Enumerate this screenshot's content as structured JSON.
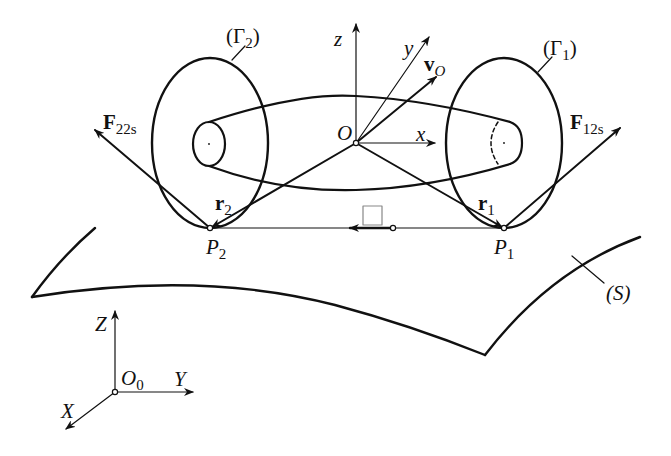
{
  "figure": {
    "colors": {
      "stroke": "#111111",
      "background": "#ffffff"
    }
  },
  "labels": {
    "gamma2": {
      "main": "(Γ",
      "sub": "2",
      "close": ")"
    },
    "gamma1": {
      "main": "(Γ",
      "sub": "1",
      "close": ")"
    },
    "z": "z",
    "y": "y",
    "x": "x",
    "O": "O",
    "vO": {
      "main": "v",
      "sub": "O"
    },
    "F22s": {
      "main": "F",
      "sub": "22s"
    },
    "F12s": {
      "main": "F",
      "sub": "12s"
    },
    "r2": {
      "main": "r",
      "sub": "2"
    },
    "r1": {
      "main": "r",
      "sub": "1"
    },
    "P2": {
      "main": "P",
      "sub": "2"
    },
    "P1": {
      "main": "P",
      "sub": "1"
    },
    "S": "(S)",
    "Z": "Z",
    "Y": "Y",
    "X": "X",
    "O0": {
      "main": "O",
      "sub": "0"
    }
  },
  "points": {
    "O": [
      356,
      143
    ],
    "P1": [
      504,
      228
    ],
    "P2": [
      210,
      228
    ],
    "O0": [
      115,
      392
    ]
  }
}
